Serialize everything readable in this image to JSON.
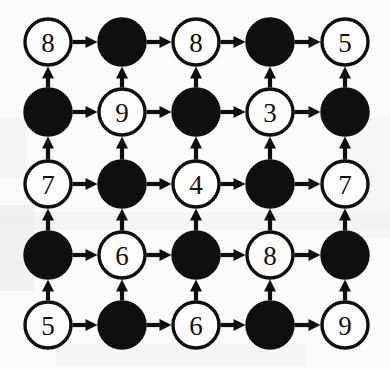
{
  "figure": {
    "type": "grid-digraph",
    "rows": 5,
    "columns": 5,
    "background_color": "#fbfbfa",
    "ink_color": "#100f0d",
    "open_node_fill": "#fdfdfc"
  },
  "geometry": {
    "width": 390,
    "height": 369,
    "column_x": [
      48,
      122,
      196,
      270,
      345
    ],
    "row_y": [
      42,
      112,
      184,
      255,
      325
    ],
    "node_radius": 23,
    "edge_stroke_width": 4.2,
    "node_stroke_width": 3.4
  },
  "legend": {
    "open_node_meaning": "numbered vertex",
    "filled_node_meaning": "unnumbered vertex",
    "horizontal_edge_direction": "left-to-right",
    "vertical_edge_direction": "bottom-to-top"
  },
  "chart_data": {
    "type": "diagram",
    "grid": [
      [
        {
          "id": "r0c0",
          "row": 0,
          "col": 0,
          "style": "open",
          "label": "8"
        },
        {
          "id": "r0c1",
          "row": 0,
          "col": 1,
          "style": "filled",
          "label": ""
        },
        {
          "id": "r0c2",
          "row": 0,
          "col": 2,
          "style": "open",
          "label": "8"
        },
        {
          "id": "r0c3",
          "row": 0,
          "col": 3,
          "style": "filled",
          "label": ""
        },
        {
          "id": "r0c4",
          "row": 0,
          "col": 4,
          "style": "open",
          "label": "5"
        }
      ],
      [
        {
          "id": "r1c0",
          "row": 1,
          "col": 0,
          "style": "filled",
          "label": ""
        },
        {
          "id": "r1c1",
          "row": 1,
          "col": 1,
          "style": "open",
          "label": "9"
        },
        {
          "id": "r1c2",
          "row": 1,
          "col": 2,
          "style": "filled",
          "label": ""
        },
        {
          "id": "r1c3",
          "row": 1,
          "col": 3,
          "style": "open",
          "label": "3"
        },
        {
          "id": "r1c4",
          "row": 1,
          "col": 4,
          "style": "filled",
          "label": ""
        }
      ],
      [
        {
          "id": "r2c0",
          "row": 2,
          "col": 0,
          "style": "open",
          "label": "7"
        },
        {
          "id": "r2c1",
          "row": 2,
          "col": 1,
          "style": "filled",
          "label": ""
        },
        {
          "id": "r2c2",
          "row": 2,
          "col": 2,
          "style": "open",
          "label": "4"
        },
        {
          "id": "r2c3",
          "row": 2,
          "col": 3,
          "style": "filled",
          "label": ""
        },
        {
          "id": "r2c4",
          "row": 2,
          "col": 4,
          "style": "open",
          "label": "7"
        }
      ],
      [
        {
          "id": "r3c0",
          "row": 3,
          "col": 0,
          "style": "filled",
          "label": ""
        },
        {
          "id": "r3c1",
          "row": 3,
          "col": 1,
          "style": "open",
          "label": "6"
        },
        {
          "id": "r3c2",
          "row": 3,
          "col": 2,
          "style": "filled",
          "label": ""
        },
        {
          "id": "r3c3",
          "row": 3,
          "col": 3,
          "style": "open",
          "label": "8"
        },
        {
          "id": "r3c4",
          "row": 3,
          "col": 4,
          "style": "filled",
          "label": ""
        }
      ],
      [
        {
          "id": "r4c0",
          "row": 4,
          "col": 0,
          "style": "open",
          "label": "5"
        },
        {
          "id": "r4c1",
          "row": 4,
          "col": 1,
          "style": "filled",
          "label": ""
        },
        {
          "id": "r4c2",
          "row": 4,
          "col": 2,
          "style": "open",
          "label": "6"
        },
        {
          "id": "r4c3",
          "row": 4,
          "col": 3,
          "style": "filled",
          "label": ""
        },
        {
          "id": "r4c4",
          "row": 4,
          "col": 4,
          "style": "open",
          "label": "9"
        }
      ]
    ],
    "labels_by_row_top_to_bottom": [
      [
        "8",
        "",
        "8",
        "",
        "5"
      ],
      [
        "",
        "9",
        "",
        "3",
        ""
      ],
      [
        "7",
        "",
        "4",
        "",
        "7"
      ],
      [
        "",
        "6",
        "",
        "8",
        ""
      ],
      [
        "5",
        "",
        "6",
        "",
        "9"
      ]
    ],
    "edges": {
      "horizontal": {
        "direction": "right",
        "count": 20,
        "description": "every adjacent pair in each row, arrow pointing right"
      },
      "vertical": {
        "direction": "up",
        "count": 20,
        "description": "every adjacent pair in each column, arrow pointing up"
      }
    }
  }
}
